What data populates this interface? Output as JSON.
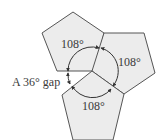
{
  "diagram": {
    "pentagons": [
      {
        "id": "top",
        "angle_label": "108°",
        "points": "73,12 104,33 95,71 57,71 42,33"
      },
      {
        "id": "right",
        "angle_label": "108°",
        "points": "104,33 144,33 155,73 124,94 92,71"
      },
      {
        "id": "bottom",
        "angle_label": "108°",
        "points": "92,71 124,94 113,140 73,140 62,95"
      }
    ],
    "gap_label": "A 36° gap",
    "colors": {
      "fill": "#ececec",
      "stroke": "#555555",
      "text": "#3a3a3a"
    }
  }
}
